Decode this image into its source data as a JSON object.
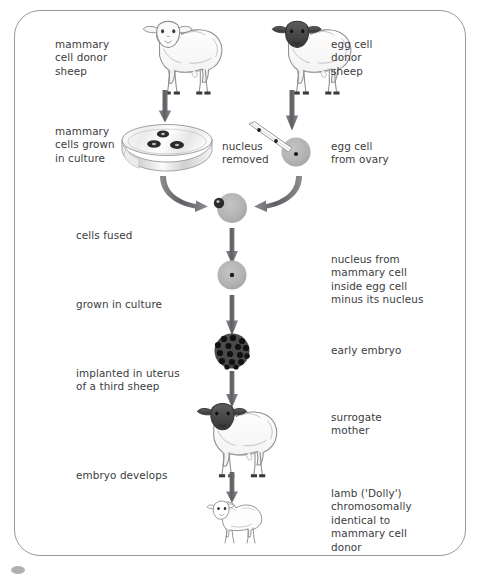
{
  "figure": {
    "frame_color": "#9a9a9f",
    "text_color": "#3b3b3d",
    "arrow_color": "#6b6b70",
    "cell_fill": "#b4b4b4",
    "nucleus_color": "#222222",
    "dark_face_color": "#4a4a4a"
  },
  "labels": {
    "mammary_donor": "mammary\ncell donor\nsheep",
    "egg_donor": "egg cell\ndonor\nsheep",
    "mammary_culture": "mammary\ncells grown\nin culture",
    "nucleus_removed": "nucleus\nremoved",
    "egg_from_ovary": "egg cell\nfrom ovary",
    "cells_fused": "cells fused",
    "nucleus_inside": "nucleus from\nmammary cell\ninside egg cell\nminus its nucleus",
    "grown_in_culture": "grown in culture",
    "early_embryo": "early embryo",
    "implanted": "implanted in uterus\nof a third sheep",
    "surrogate_mother": "surrogate\nmother",
    "embryo_develops": "embryo develops",
    "lamb_dolly": "lamb ('Dolly')\nchromosomally\nidentical to\nmammary cell\ndonor"
  },
  "figure_elements": {
    "sheep_white_face": "mammary cell donor sheep illustration",
    "sheep_dark_face": "egg cell donor sheep illustration",
    "petri_dish": "petri dish with three mammary cells",
    "pipette": "micro-pipette removing nucleus",
    "egg_cell": "egg cell with nucleus",
    "fused_cell": "fused cell with transferred nucleus",
    "cultured_cell": "cell grown in culture with nucleus",
    "embryo": "early embryo cell cluster",
    "surrogate_sheep": "surrogate mother sheep illustration",
    "lamb": "lamb Dolly illustration"
  }
}
